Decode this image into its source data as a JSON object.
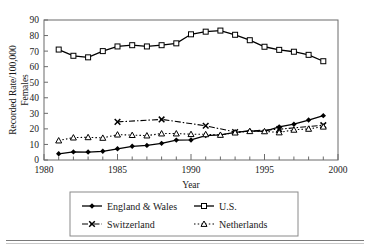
{
  "figure": {
    "background": "#ffffff",
    "ink": "#000000",
    "axis_color": "#6b6b6b"
  },
  "axes": {
    "x_title": "Year",
    "y_title_line1": "Recorded Rate/100,000",
    "y_title_line2": "Females",
    "x_ticklabels": [
      "1980",
      "1985",
      "1990",
      "1995",
      "2000"
    ],
    "y_ticklabels": [
      "0",
      "10",
      "20",
      "30",
      "40",
      "50",
      "60",
      "70",
      "80",
      "90"
    ]
  },
  "legend": {
    "items": [
      {
        "label": "England & Wales",
        "marker": "filled-diamond",
        "dash": "solid"
      },
      {
        "label": "U.S.",
        "marker": "open-square",
        "dash": "solid"
      },
      {
        "label": "Switzerland",
        "marker": "cross-x",
        "dash": "dash-dot"
      },
      {
        "label": "Netherlands",
        "marker": "open-triangle",
        "dash": "dotted"
      }
    ]
  },
  "chart_data": {
    "type": "line",
    "title": "",
    "xlabel": "Year",
    "ylabel": "Recorded Rate/100,000 Females",
    "xlim": [
      1980,
      2000
    ],
    "ylim": [
      0,
      90
    ],
    "xticks": [
      1980,
      1985,
      1990,
      1995,
      2000
    ],
    "yticks": [
      0,
      10,
      20,
      30,
      40,
      50,
      60,
      70,
      80,
      90
    ],
    "x_minor_tick_interval": 1,
    "grid": false,
    "legend_position": "below-plot",
    "series": [
      {
        "name": "England & Wales",
        "marker": "filled-diamond",
        "dash": "solid",
        "x": [
          1981,
          1982,
          1983,
          1984,
          1985,
          1986,
          1987,
          1988,
          1989,
          1990,
          1991,
          1992,
          1993,
          1994,
          1995,
          1996,
          1997,
          1998,
          1999
        ],
        "values": [
          4.0,
          5.2,
          5.1,
          5.6,
          7.2,
          8.8,
          9.4,
          10.7,
          12.8,
          12.9,
          15.7,
          16.1,
          17.8,
          18.7,
          18.4,
          21.3,
          23.0,
          25.7,
          28.5
        ]
      },
      {
        "name": "U.S.",
        "marker": "open-square",
        "dash": "solid",
        "x": [
          1981,
          1982,
          1983,
          1984,
          1985,
          1986,
          1987,
          1988,
          1989,
          1990,
          1991,
          1992,
          1993,
          1994,
          1995,
          1996,
          1997,
          1998,
          1999
        ],
        "values": [
          71.0,
          67.0,
          66.0,
          70.0,
          73.0,
          73.8,
          73.0,
          73.8,
          75.0,
          80.8,
          82.5,
          83.2,
          80.5,
          77.0,
          72.8,
          70.8,
          69.6,
          67.6,
          63.5
        ]
      },
      {
        "name": "Switzerland",
        "marker": "cross-x",
        "dash": "dash-dot",
        "x": [
          1985,
          1988,
          1991,
          1993,
          1996,
          1999
        ],
        "values": [
          24.5,
          26.1,
          22.0,
          18.0,
          19.8,
          22.4
        ]
      },
      {
        "name": "Netherlands",
        "marker": "open-triangle",
        "dash": "dotted",
        "x": [
          1981,
          1982,
          1983,
          1984,
          1985,
          1986,
          1987,
          1988,
          1989,
          1990,
          1991,
          1992,
          1993,
          1994,
          1995,
          1996,
          1997,
          1998,
          1999
        ],
        "values": [
          12.5,
          14.4,
          14.6,
          14.2,
          16.3,
          16.0,
          15.7,
          17.0,
          17.0,
          16.6,
          16.5,
          16.1,
          17.6,
          18.5,
          18.4,
          17.7,
          19.4,
          20.0,
          21.4
        ]
      }
    ]
  }
}
